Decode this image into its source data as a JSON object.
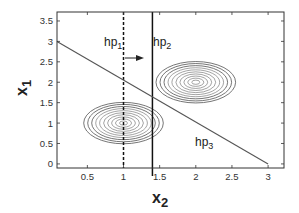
{
  "chart_data": {
    "type": "contour",
    "title": "",
    "xlabel": "x",
    "xlabel_sub": "2",
    "ylabel": "x",
    "ylabel_sub": "1",
    "xlim": [
      0.08,
      3.22
    ],
    "ylim": [
      -0.1,
      3.72
    ],
    "x_ticks": [
      0.5,
      1,
      1.5,
      2,
      2.5,
      3
    ],
    "x_tick_labels": [
      "0.5",
      "1",
      "1.5",
      "2",
      "2.5",
      "3"
    ],
    "y_ticks": [
      0,
      0.5,
      1,
      1.5,
      2,
      2.5,
      3,
      3.5
    ],
    "y_tick_labels": [
      "0",
      "0.5",
      "1",
      "1.5",
      "2",
      "2.5",
      "3",
      "3.5"
    ],
    "grid": false,
    "gaussians": [
      {
        "center": [
          1,
          1
        ],
        "sx": 0.55,
        "sy": 0.35,
        "levels": 10
      },
      {
        "center": [
          2,
          2
        ],
        "sx": 0.55,
        "sy": 0.35,
        "levels": 10
      }
    ],
    "lines": [
      {
        "name": "hp1",
        "type": "vertical",
        "x": 1.0,
        "style": "dashed"
      },
      {
        "name": "hp2",
        "type": "vertical",
        "x": 1.4,
        "style": "solid"
      },
      {
        "name": "hp3",
        "type": "line",
        "from": [
          0.08,
          3.0
        ],
        "to": [
          3.0,
          0.0
        ],
        "equation": "x1 + x2 = 3",
        "style": "solid"
      }
    ],
    "annotations": [
      {
        "text": "hp",
        "sub": "1",
        "x": 1.02,
        "y": 3.0
      },
      {
        "text": "hp",
        "sub": "2",
        "x": 1.45,
        "y": 3.0
      },
      {
        "text": "hp",
        "sub": "3",
        "x": 2.2,
        "y": 0.6
      },
      {
        "text": "arrow",
        "from": [
          1.15,
          2.7
        ],
        "to": [
          1.35,
          2.7
        ]
      }
    ]
  },
  "labels": {
    "hp1": "hp",
    "hp1_sub": "1",
    "hp2": "hp",
    "hp2_sub": "2",
    "hp3": "hp",
    "hp3_sub": "3",
    "xlabel": "x",
    "xlabel_sub": "2",
    "ylabel": "x",
    "ylabel_sub": "1"
  },
  "colors": {
    "axis": "#333333",
    "contour": "#666666",
    "hp3_line": "#555555",
    "hp_lines": "#111111"
  }
}
